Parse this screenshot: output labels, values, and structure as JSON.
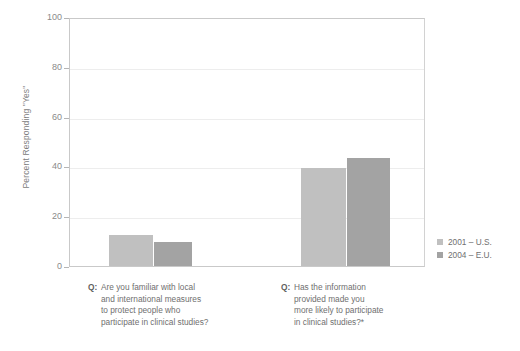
{
  "chart_data": {
    "type": "bar",
    "title": "",
    "subtitle": "",
    "xlabel": "",
    "ylabel": "Percent Responding \"Yes\"",
    "ylim": [
      0,
      100
    ],
    "yticks": [
      0,
      20,
      40,
      60,
      80,
      100
    ],
    "ytick_labels": [
      "0",
      "20",
      "40",
      "60",
      "80",
      "100"
    ],
    "grid": "horizontal",
    "legend_position": "right-bottom",
    "categories": [
      "Q: Are you familiar with local and international measures to protect people who participate in clinical studies?",
      "Q: Has the information provided made you more likely to participate in clinical studies?*"
    ],
    "category_lines": [
      [
        "Are you familiar with local",
        "and international measures",
        "to protect people who",
        "participate in clinical studies?"
      ],
      [
        "Has the information",
        "provided made you",
        "more likely to participate",
        "in clinical studies?*"
      ]
    ],
    "category_prefix": "Q:",
    "series": [
      {
        "name": "2001 – U.S.",
        "color": "#c0c0c0",
        "values": [
          12.4,
          39.4
        ]
      },
      {
        "name": "2004 – E.U.",
        "color": "#a3a3a3",
        "values": [
          9.6,
          43.4
        ]
      }
    ],
    "annotations": [
      "*"
    ]
  },
  "legend": {
    "items": [
      {
        "label": "2001 – U.S.",
        "color": "#c0c0c0"
      },
      {
        "label": "2004 – E.U.",
        "color": "#a3a3a3"
      }
    ]
  },
  "axis": {
    "y_title": "Percent Responding \"Yes\"",
    "y_labels": [
      "100",
      "80",
      "60",
      "40",
      "20",
      "0"
    ]
  }
}
